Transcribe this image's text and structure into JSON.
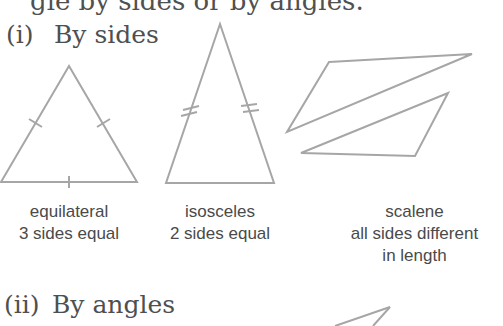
{
  "top_line": "gle by sides or by angles.",
  "sections": [
    {
      "number": "(i)",
      "title": "By sides"
    },
    {
      "number": "(ii)",
      "title": "By angles"
    }
  ],
  "triangles_by_sides": [
    {
      "name": "equilateral",
      "description": "3 sides equal",
      "tick_marks": "single tick on each of 3 sides"
    },
    {
      "name": "isosceles",
      "description": "2 sides equal",
      "tick_marks": "double tick on 2 sides"
    },
    {
      "name": "scalene",
      "description": "all sides different",
      "description_line2": "in length",
      "tick_marks": "none"
    }
  ],
  "colors": {
    "text": "#4a4a4a",
    "lines": "#a6a6a6",
    "background": "#ffffff"
  }
}
